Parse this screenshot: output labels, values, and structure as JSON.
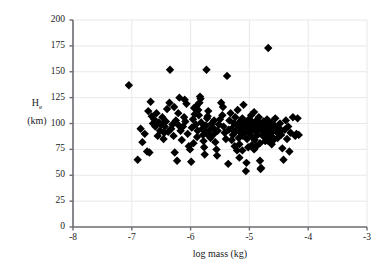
{
  "chart_data": {
    "type": "scatter",
    "title": "",
    "xlabel": "log mass (kg)",
    "ylabel": "H_e (km)",
    "ylabel_main": "H",
    "ylabel_sub": "e",
    "ylabel_units": "(km)",
    "xlim": [
      -8,
      -3
    ],
    "ylim": [
      0,
      200
    ],
    "xticks": [
      -8,
      -7,
      -6,
      -5,
      -4,
      -3
    ],
    "xtick_labels": [
      "-8",
      "-7",
      "-6",
      "-5",
      "-4",
      "-3"
    ],
    "yticks": [
      0,
      25,
      50,
      75,
      100,
      125,
      150,
      175,
      200
    ],
    "ytick_labels": [
      "0",
      "25",
      "50",
      "75",
      "100",
      "125",
      "150",
      "175",
      "200"
    ],
    "grid": true,
    "grid_color": "#e8e8ec",
    "axis_color": "#6b6b70",
    "marker": "diamond",
    "marker_color": "#000000",
    "marker_size": 4.2,
    "legend": "none",
    "n_points": 196,
    "points": [
      [
        -7.05,
        137
      ],
      [
        -6.9,
        65
      ],
      [
        -6.85,
        95
      ],
      [
        -6.82,
        82
      ],
      [
        -6.78,
        90
      ],
      [
        -6.74,
        73
      ],
      [
        -6.7,
        72
      ],
      [
        -6.68,
        121
      ],
      [
        -6.64,
        100
      ],
      [
        -6.62,
        104
      ],
      [
        -6.6,
        97
      ],
      [
        -6.58,
        110
      ],
      [
        -6.56,
        88
      ],
      [
        -6.54,
        101
      ],
      [
        -6.52,
        93
      ],
      [
        -6.5,
        99
      ],
      [
        -6.48,
        106
      ],
      [
        -6.46,
        85
      ],
      [
        -6.44,
        97
      ],
      [
        -6.42,
        102
      ],
      [
        -6.4,
        114
      ],
      [
        -6.38,
        92
      ],
      [
        -6.36,
        120
      ],
      [
        -6.35,
        152
      ],
      [
        -6.33,
        95
      ],
      [
        -6.31,
        99
      ],
      [
        -6.29,
        88
      ],
      [
        -6.27,
        72
      ],
      [
        -6.25,
        103
      ],
      [
        -6.23,
        64
      ],
      [
        -6.21,
        110
      ],
      [
        -6.19,
        125
      ],
      [
        -6.17,
        93
      ],
      [
        -6.15,
        84
      ],
      [
        -6.13,
        97
      ],
      [
        -6.11,
        106
      ],
      [
        -6.09,
        102
      ],
      [
        -6.07,
        119
      ],
      [
        -6.05,
        90
      ],
      [
        -6.03,
        78
      ],
      [
        -6.01,
        75
      ],
      [
        -5.99,
        63
      ],
      [
        -5.98,
        96
      ],
      [
        -5.96,
        104
      ],
      [
        -5.94,
        115
      ],
      [
        -5.93,
        109
      ],
      [
        -5.91,
        99
      ],
      [
        -5.89,
        87
      ],
      [
        -5.88,
        93
      ],
      [
        -5.86,
        108
      ],
      [
        -5.85,
        120
      ],
      [
        -5.84,
        126
      ],
      [
        -5.83,
        124
      ],
      [
        -5.82,
        101
      ],
      [
        -5.8,
        95
      ],
      [
        -5.79,
        89
      ],
      [
        -5.78,
        83
      ],
      [
        -5.77,
        77
      ],
      [
        -5.76,
        70
      ],
      [
        -5.75,
        92
      ],
      [
        -5.74,
        98
      ],
      [
        -5.73,
        152
      ],
      [
        -5.72,
        105
      ],
      [
        -5.7,
        112
      ],
      [
        -5.69,
        88
      ],
      [
        -5.67,
        94
      ],
      [
        -5.66,
        86
      ],
      [
        -5.64,
        100
      ],
      [
        -5.62,
        96
      ],
      [
        -5.6,
        90
      ],
      [
        -5.58,
        82
      ],
      [
        -5.56,
        75
      ],
      [
        -5.54,
        93
      ],
      [
        -5.52,
        99
      ],
      [
        -5.5,
        104
      ],
      [
        -5.48,
        120
      ],
      [
        -5.46,
        108
      ],
      [
        -5.44,
        97
      ],
      [
        -5.42,
        91
      ],
      [
        -5.4,
        85
      ],
      [
        -5.38,
        146
      ],
      [
        -5.36,
        61
      ],
      [
        -5.34,
        103
      ],
      [
        -5.32,
        110
      ],
      [
        -5.3,
        95
      ],
      [
        -5.28,
        89
      ],
      [
        -5.26,
        100
      ],
      [
        -5.24,
        106
      ],
      [
        -5.22,
        93
      ],
      [
        -5.2,
        113
      ],
      [
        -5.19,
        97
      ],
      [
        -5.18,
        86
      ],
      [
        -5.17,
        80
      ],
      [
        -5.16,
        102
      ],
      [
        -5.15,
        91
      ],
      [
        -5.14,
        99
      ],
      [
        -5.13,
        95
      ],
      [
        -5.12,
        105
      ],
      [
        -5.11,
        88
      ],
      [
        -5.1,
        118
      ],
      [
        -5.09,
        101
      ],
      [
        -5.08,
        97
      ],
      [
        -5.07,
        92
      ],
      [
        -5.06,
        54
      ],
      [
        -5.05,
        62
      ],
      [
        -5.04,
        85
      ],
      [
        -5.03,
        100
      ],
      [
        -5.02,
        96
      ],
      [
        -5.01,
        104
      ],
      [
        -5.0,
        90
      ],
      [
        -4.99,
        98
      ],
      [
        -4.98,
        93
      ],
      [
        -4.97,
        108
      ],
      [
        -4.96,
        102
      ],
      [
        -4.95,
        87
      ],
      [
        -4.94,
        95
      ],
      [
        -4.93,
        100
      ],
      [
        -4.92,
        111
      ],
      [
        -4.91,
        84
      ],
      [
        -4.9,
        97
      ],
      [
        -4.89,
        92
      ],
      [
        -4.88,
        103
      ],
      [
        -4.87,
        99
      ],
      [
        -4.86,
        89
      ],
      [
        -4.85,
        96
      ],
      [
        -4.84,
        106
      ],
      [
        -4.83,
        101
      ],
      [
        -4.82,
        64
      ],
      [
        -4.81,
        56
      ],
      [
        -4.8,
        57
      ],
      [
        -4.79,
        93
      ],
      [
        -4.78,
        98
      ],
      [
        -4.77,
        88
      ],
      [
        -4.76,
        102
      ],
      [
        -4.75,
        95
      ],
      [
        -4.74,
        100
      ],
      [
        -4.73,
        83
      ],
      [
        -4.72,
        91
      ],
      [
        -4.71,
        97
      ],
      [
        -4.7,
        104
      ],
      [
        -4.69,
        86
      ],
      [
        -4.68,
        173
      ],
      [
        -4.67,
        94
      ],
      [
        -4.66,
        99
      ],
      [
        -4.65,
        82
      ],
      [
        -4.64,
        90
      ],
      [
        -4.63,
        96
      ],
      [
        -4.62,
        101
      ],
      [
        -4.61,
        87
      ],
      [
        -4.6,
        93
      ],
      [
        -4.59,
        84
      ],
      [
        -4.58,
        98
      ],
      [
        -4.56,
        105
      ],
      [
        -4.54,
        92
      ],
      [
        -4.52,
        86
      ],
      [
        -4.5,
        96
      ],
      [
        -4.48,
        100
      ],
      [
        -4.46,
        89
      ],
      [
        -4.44,
        76
      ],
      [
        -4.42,
        65
      ],
      [
        -4.4,
        94
      ],
      [
        -4.38,
        103
      ],
      [
        -4.36,
        85
      ],
      [
        -4.34,
        97
      ],
      [
        -4.32,
        73
      ],
      [
        -4.3,
        91
      ],
      [
        -4.26,
        106
      ],
      [
        -4.22,
        88
      ],
      [
        -4.2,
        90
      ],
      [
        -4.18,
        105
      ],
      [
        -4.16,
        89
      ],
      [
        -6.72,
        112
      ],
      [
        -6.45,
        91
      ],
      [
        -6.28,
        116
      ],
      [
        -6.1,
        123
      ],
      [
        -5.95,
        81
      ],
      [
        -5.87,
        113
      ],
      [
        -5.71,
        107
      ],
      [
        -5.55,
        69
      ],
      [
        -5.45,
        116
      ],
      [
        -5.35,
        94
      ],
      [
        -5.25,
        78
      ],
      [
        -5.21,
        74
      ],
      [
        -5.17,
        67
      ],
      [
        -5.12,
        74
      ],
      [
        -5.02,
        77
      ],
      [
        -4.96,
        79
      ],
      [
        -4.88,
        78
      ],
      [
        -4.82,
        81
      ],
      [
        -4.74,
        87
      ],
      [
        -4.68,
        83
      ],
      [
        -4.62,
        80
      ],
      [
        -4.55,
        95
      ],
      [
        -4.49,
        92
      ],
      [
        -6.66,
        107
      ],
      [
        -6.2,
        98
      ],
      [
        -5.9,
        117
      ],
      [
        -5.6,
        103
      ],
      [
        -5.3,
        84
      ],
      [
        -4.92,
        75
      ]
    ]
  }
}
